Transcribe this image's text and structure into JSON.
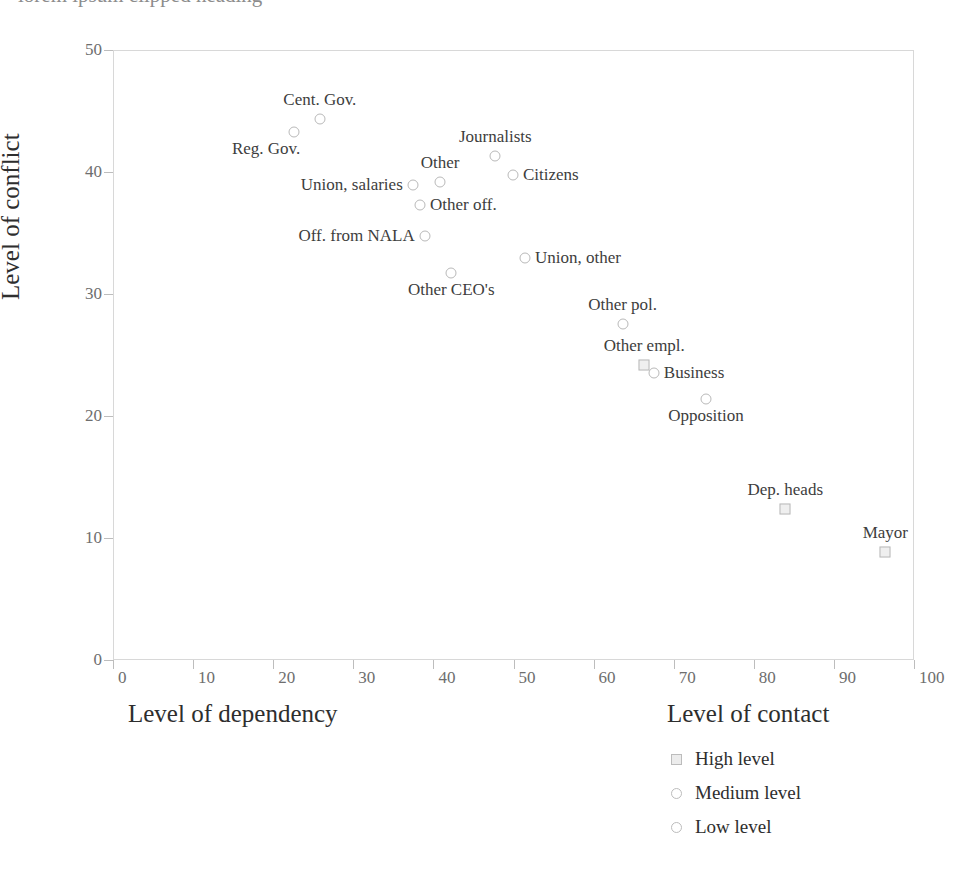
{
  "top_clipped_text": "lorem ipsum clipped heading",
  "chart_data": {
    "type": "scatter",
    "title": "",
    "xlabel": "Level of dependency",
    "ylabel": "Level of conflict",
    "xlim": [
      0,
      100
    ],
    "ylim": [
      0,
      50
    ],
    "xticks": [
      0,
      10,
      20,
      30,
      40,
      50,
      60,
      70,
      80,
      90,
      100
    ],
    "yticks": [
      0,
      10,
      20,
      30,
      40,
      50
    ],
    "grid": false,
    "legend": {
      "title": "Level of contact",
      "position": "below-right",
      "entries": [
        {
          "label": "High level",
          "marker": "square"
        },
        {
          "label": "Medium level",
          "marker": "circle"
        },
        {
          "label": "Low level",
          "marker": "circle"
        }
      ]
    },
    "points": [
      {
        "label": "Cent. Gov.",
        "x": 25.7,
        "y": 44.4,
        "marker": "circle",
        "label_pos": "above"
      },
      {
        "label": "Reg. Gov.",
        "x": 22.5,
        "y": 43.4,
        "marker": "circle",
        "label_pos": "below-left"
      },
      {
        "label": "Journalists",
        "x": 47.6,
        "y": 41.4,
        "marker": "circle",
        "label_pos": "above"
      },
      {
        "label": "Citizens",
        "x": 49.8,
        "y": 39.8,
        "marker": "circle",
        "label_pos": "right"
      },
      {
        "label": "Other",
        "x": 40.7,
        "y": 39.3,
        "marker": "circle",
        "label_pos": "above"
      },
      {
        "label": "Union, salaries",
        "x": 37.3,
        "y": 39.0,
        "marker": "circle",
        "label_pos": "left"
      },
      {
        "label": "Other off.",
        "x": 38.2,
        "y": 37.4,
        "marker": "circle",
        "label_pos": "right"
      },
      {
        "label": "Off. from NALA",
        "x": 38.8,
        "y": 34.8,
        "marker": "circle",
        "label_pos": "left"
      },
      {
        "label": "Union, other",
        "x": 51.3,
        "y": 33.0,
        "marker": "circle",
        "label_pos": "right"
      },
      {
        "label": "Other CEO's",
        "x": 42.1,
        "y": 31.8,
        "marker": "circle",
        "label_pos": "below"
      },
      {
        "label": "Other pol.",
        "x": 63.5,
        "y": 27.6,
        "marker": "circle",
        "label_pos": "above"
      },
      {
        "label": "Other empl.",
        "x": 66.2,
        "y": 24.3,
        "marker": "square",
        "label_pos": "above"
      },
      {
        "label": "Business",
        "x": 67.4,
        "y": 23.6,
        "marker": "circle",
        "label_pos": "right"
      },
      {
        "label": "Opposition",
        "x": 73.9,
        "y": 21.5,
        "marker": "circle",
        "label_pos": "below"
      },
      {
        "label": "Dep. heads",
        "x": 83.8,
        "y": 12.5,
        "marker": "square",
        "label_pos": "above"
      },
      {
        "label": "Mayor",
        "x": 96.3,
        "y": 8.9,
        "marker": "square",
        "label_pos": "above"
      }
    ]
  }
}
